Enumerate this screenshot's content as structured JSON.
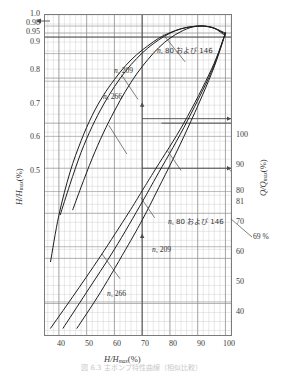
{
  "figure": {
    "caption": "図 6.3  主ポンプ特性曲線（相似比較）"
  },
  "axes": {
    "x": {
      "label_main": "H/H",
      "label_sub": "max",
      "label_unit": "(%)",
      "ticks": [
        "40",
        "50",
        "60",
        "70",
        "80",
        "90",
        "100"
      ],
      "tick_values": [
        40,
        50,
        60,
        70,
        80,
        90,
        100
      ],
      "min": 35,
      "max": 102,
      "minor_step": 2
    },
    "y_left": {
      "label_main": "H/H",
      "label_sub": "max",
      "label_unit": "(%)",
      "ticks": [
        "1.0",
        "0.98",
        "0.95",
        "0.9",
        "0.8",
        "0.7",
        "0.6",
        "0.5"
      ],
      "tick_values": [
        1.0,
        0.98,
        0.95,
        0.9,
        0.8,
        0.7,
        0.6,
        0.5
      ],
      "min": 0.44,
      "max": 1.02
    },
    "y_right": {
      "label_main": "Q/Q",
      "label_sub": "max",
      "label_unit": "(%)",
      "ticks": [
        "100",
        "90",
        "80",
        "81",
        "70",
        "60",
        "50",
        "40"
      ],
      "tick_values": [
        100,
        90,
        80,
        81,
        70,
        60,
        50,
        40
      ],
      "min": 33,
      "max": 104
    }
  },
  "annotations": {
    "upper_ns80": "n  80 および 146",
    "upper_ns80_ns": "n",
    "upper_ns80_sub": "s",
    "upper_ns80_rest": " 80 および 146",
    "upper_ns209_ns": "n",
    "upper_ns209_sub": "s",
    "upper_ns209_rest": " 209",
    "upper_ns266_ns": "n",
    "upper_ns266_sub": "s",
    "upper_ns266_rest": " 266",
    "lower_ns80_ns": "n",
    "lower_ns80_sub": "s",
    "lower_ns80_rest": " 80 および 146",
    "lower_ns209_ns": "n",
    "lower_ns209_sub": "s",
    "lower_ns209_rest": " 209",
    "lower_ns266_ns": "n",
    "lower_ns266_sub": "s",
    "lower_ns266_rest": " 266",
    "callout_69": "69 %"
  },
  "chart_data": {
    "type": "line",
    "title": "",
    "xlabel": "H/Hmax (%)",
    "ylabel": "H/Hmax (%)",
    "ylabel_right": "Q/Qmax (%)",
    "xlim": [
      35,
      102
    ],
    "ylim_left": [
      0.44,
      1.02
    ],
    "ylim_right": [
      33,
      104
    ],
    "grid": true,
    "legend_position": "inline-callouts",
    "reference_lines": [
      {
        "name": "vertical-70",
        "orientation": "vertical",
        "x": 70
      },
      {
        "name": "horizontal-81",
        "orientation": "horizontal",
        "y_right": 81
      },
      {
        "name": "horizontal-80",
        "orientation": "horizontal",
        "y_right": 80
      },
      {
        "name": "horizontal-70",
        "orientation": "horizontal",
        "y_right": 70
      },
      {
        "name": "horizontal-098",
        "orientation": "horizontal",
        "y_left": 0.98
      }
    ],
    "series": [
      {
        "name": "ns 80 および 146 (upper, H/Hmax)",
        "group": "upper",
        "x": [
          37.0,
          40,
          44,
          48,
          52,
          56,
          60,
          64,
          68,
          72,
          76,
          80,
          84,
          88,
          92,
          96,
          100
        ],
        "y": [
          0.573,
          0.657,
          0.735,
          0.792,
          0.838,
          0.874,
          0.903,
          0.928,
          0.948,
          0.964,
          0.978,
          0.988,
          0.995,
          0.999,
          1.0,
          0.996,
          0.985
        ]
      },
      {
        "name": "ns 209 (upper, H/Hmax)",
        "group": "upper",
        "x": [
          40.5,
          44,
          48,
          52,
          56,
          60,
          64,
          68,
          72,
          76,
          80,
          84,
          88,
          92,
          96,
          100
        ],
        "y": [
          0.658,
          0.713,
          0.771,
          0.818,
          0.857,
          0.89,
          0.918,
          0.941,
          0.96,
          0.975,
          0.987,
          0.995,
          0.999,
          1.0,
          0.996,
          0.987
        ]
      },
      {
        "name": "ns 266 (upper, H/Hmax)",
        "group": "upper",
        "x": [
          45.0,
          48,
          52,
          56,
          60,
          64,
          68,
          72,
          76,
          80,
          84,
          88,
          92,
          96,
          100
        ],
        "y": [
          0.667,
          0.708,
          0.76,
          0.806,
          0.846,
          0.882,
          0.913,
          0.939,
          0.961,
          0.978,
          0.99,
          0.998,
          1.0,
          0.996,
          0.982
        ]
      },
      {
        "name": "ns 80 および 146 (lower, Q/Qmax)",
        "group": "lower",
        "x": [
          37.0,
          45,
          55,
          65,
          70,
          75,
          85,
          95,
          100
        ],
        "y_right": [
          34.5,
          41.5,
          50.5,
          60.0,
          65.0,
          70.0,
          80.0,
          92.0,
          100.0
        ]
      },
      {
        "name": "ns 209 (lower, Q/Qmax)",
        "group": "lower",
        "x": [
          41.5,
          50,
          60,
          70,
          75,
          85,
          95,
          100
        ],
        "y_right": [
          34.5,
          42.5,
          52.0,
          62.5,
          68.0,
          79.0,
          91.5,
          100.0
        ]
      },
      {
        "name": "ns 266 (lower, Q/Qmax)",
        "group": "lower",
        "x": [
          46.5,
          55,
          65,
          70,
          75,
          85,
          95,
          100
        ],
        "y_right": [
          34.5,
          42.5,
          53.0,
          58.5,
          64.5,
          77.0,
          91.0,
          100.0
        ]
      }
    ],
    "readout": {
      "x_at_marker": 70,
      "y_left_at_marker": 0.98,
      "y_right_values": [
        81,
        70
      ],
      "efficiency_note": "69 %"
    }
  }
}
